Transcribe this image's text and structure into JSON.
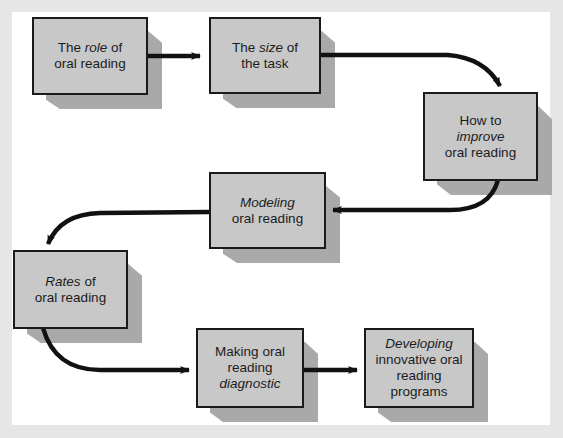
{
  "diagram": {
    "type": "flowchart",
    "colors": {
      "frame": "#e6e6e6",
      "panel": "#ffffff",
      "node_fill": "#c8c8c8",
      "node_border": "#1a1a1a",
      "node_shadow": "#a9a9a9",
      "arrow": "#111111"
    },
    "nodes": [
      {
        "id": "role",
        "parts": [
          {
            "t": "The ",
            "i": false
          },
          {
            "t": "role",
            "i": true
          },
          {
            "t": " of",
            "i": false
          },
          {
            "t": "\n",
            "i": false
          },
          {
            "t": "oral reading",
            "i": false
          }
        ]
      },
      {
        "id": "size",
        "parts": [
          {
            "t": "The ",
            "i": false
          },
          {
            "t": "size",
            "i": true
          },
          {
            "t": " of",
            "i": false
          },
          {
            "t": "\n",
            "i": false
          },
          {
            "t": "the task",
            "i": false
          }
        ]
      },
      {
        "id": "improve",
        "parts": [
          {
            "t": "How to",
            "i": false
          },
          {
            "t": "\n",
            "i": false
          },
          {
            "t": "improve",
            "i": true
          },
          {
            "t": "\n",
            "i": false
          },
          {
            "t": "oral reading",
            "i": false
          }
        ]
      },
      {
        "id": "modeling",
        "parts": [
          {
            "t": "Modeling",
            "i": true
          },
          {
            "t": "\n",
            "i": false
          },
          {
            "t": "oral reading",
            "i": false
          }
        ]
      },
      {
        "id": "rates",
        "parts": [
          {
            "t": "Rates",
            "i": true
          },
          {
            "t": " of",
            "i": false
          },
          {
            "t": "\n",
            "i": false
          },
          {
            "t": "oral reading",
            "i": false
          }
        ]
      },
      {
        "id": "diagnostic",
        "parts": [
          {
            "t": "Making oral",
            "i": false
          },
          {
            "t": "\n",
            "i": false
          },
          {
            "t": "reading",
            "i": false
          },
          {
            "t": "\n",
            "i": false
          },
          {
            "t": "diagnostic",
            "i": true
          }
        ]
      },
      {
        "id": "developing",
        "parts": [
          {
            "t": "Developing",
            "i": true
          },
          {
            "t": "\n",
            "i": false
          },
          {
            "t": "innovative oral",
            "i": false
          },
          {
            "t": "\n",
            "i": false
          },
          {
            "t": "reading programs",
            "i": false
          }
        ]
      }
    ],
    "edges": [
      {
        "from": "role",
        "to": "size"
      },
      {
        "from": "size",
        "to": "improve"
      },
      {
        "from": "improve",
        "to": "modeling"
      },
      {
        "from": "modeling",
        "to": "rates"
      },
      {
        "from": "rates",
        "to": "diagnostic"
      },
      {
        "from": "diagnostic",
        "to": "developing"
      }
    ]
  }
}
